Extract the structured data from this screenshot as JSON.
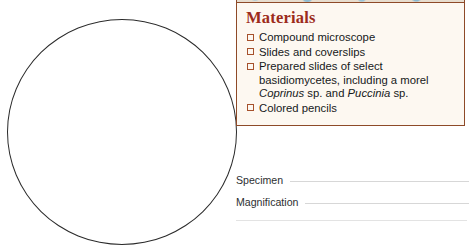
{
  "page": {
    "title": "ycetes",
    "background_color": "#ffffff"
  },
  "drawing_area": {
    "name": "specimen-drawing-circle",
    "shape": "circle",
    "border_color": "#2b2b2b"
  },
  "materials": {
    "heading": "Materials",
    "heading_color": "#9c2b1b",
    "border_color": "#8e4a28",
    "background_color": "#fdf8f1",
    "checkbox_color": "#a6512c",
    "items": [
      {
        "text": "Compound microscope",
        "html": "Compound microscope"
      },
      {
        "text": "Slides and coverslips",
        "html": "Slides and coverslips"
      },
      {
        "text": "Prepared slides of select basidiomycetes, including a morel Coprinus sp. and Puccinia sp.",
        "html": "Prepared slides of select basidiomycetes, including a morel <i>Coprinus</i> sp. and <i>Puccinia</i> sp."
      },
      {
        "text": "Colored pencils",
        "html": "Colored pencils"
      }
    ]
  },
  "record_fields": [
    {
      "label": "Specimen",
      "value": ""
    },
    {
      "label": "Magnification",
      "value": ""
    }
  ]
}
